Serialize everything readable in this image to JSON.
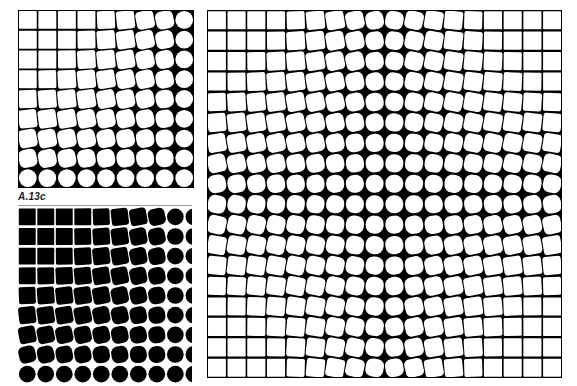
{
  "figure": {
    "label": "A.13c",
    "colors": {
      "background": "#ffffff",
      "ink": "#000000",
      "rule": "#9a9a9a"
    }
  },
  "panels": [
    {
      "id": "top-left",
      "description": "white shapes on black ground, squares at top-left morphing to circles toward bottom-right",
      "x": 18,
      "y": 10,
      "width": 176,
      "height": 178,
      "cols": 9,
      "rows": 9,
      "visible_cols": 9,
      "shape_fill": "#ffffff",
      "ground_fill": "#000000",
      "center_col": 9,
      "center_row": 9,
      "rotation_sign": 1
    },
    {
      "id": "bottom-left",
      "description": "black shapes on white ground, squares at top-left morphing to circles toward bottom-right, right edge cropped",
      "x": 18,
      "y": 207,
      "width": 174,
      "height": 177,
      "cols": 9,
      "rows": 9,
      "visible_cols": 9.4,
      "shape_fill": "#000000",
      "ground_fill": "#ffffff",
      "center_col": 9,
      "center_row": 9,
      "rotation_sign": 1
    },
    {
      "id": "right",
      "description": "white shapes on black ground, squares in all four corners morphing to circles along center band",
      "x": 207,
      "y": 10,
      "width": 355,
      "height": 368,
      "cols": 18,
      "rows": 18,
      "visible_cols": 18,
      "shape_fill": "#ffffff",
      "ground_fill": "#000000",
      "center_col": 9,
      "center_row": 9,
      "rotation_sign": 1
    }
  ]
}
